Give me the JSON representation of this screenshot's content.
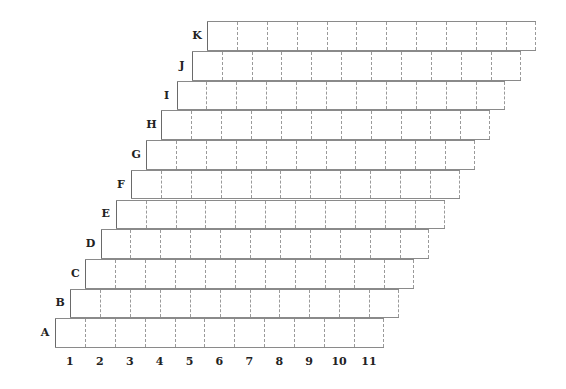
{
  "diagram": {
    "type": "staggered-grid",
    "rows": [
      "A",
      "B",
      "C",
      "D",
      "E",
      "F",
      "G",
      "H",
      "I",
      "J",
      "K"
    ],
    "columns": [
      "1",
      "2",
      "3",
      "4",
      "5",
      "6",
      "7",
      "8",
      "9",
      "10",
      "11"
    ],
    "cells_per_row": 11,
    "row_offset_px": 15.2,
    "colors": {
      "line": "#8a8a8a",
      "label": "#222222",
      "background": "#ffffff"
    }
  }
}
